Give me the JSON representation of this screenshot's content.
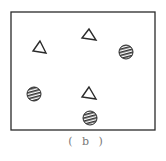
{
  "figure": {
    "caption": "( b )",
    "colors": {
      "stroke": "#2a2a2a",
      "hatch": "#333333",
      "background": "#ffffff",
      "caption": "#777777"
    },
    "frame": {
      "x": 11,
      "y": 12,
      "width": 144,
      "height": 118
    },
    "triangles": [
      {
        "name": "triangle-1",
        "points": "40,41 33,51 46,53"
      },
      {
        "name": "triangle-2",
        "points": "89,29 82,38 96,40"
      },
      {
        "name": "triangle-3",
        "points": "89,87 82,97 96,99"
      }
    ],
    "hatched_circles": [
      {
        "name": "circle-1",
        "cx": 126,
        "cy": 52,
        "r": 7
      },
      {
        "name": "circle-2",
        "cx": 34,
        "cy": 94,
        "r": 7
      },
      {
        "name": "circle-3",
        "cx": 90,
        "cy": 118,
        "r": 7
      }
    ]
  }
}
